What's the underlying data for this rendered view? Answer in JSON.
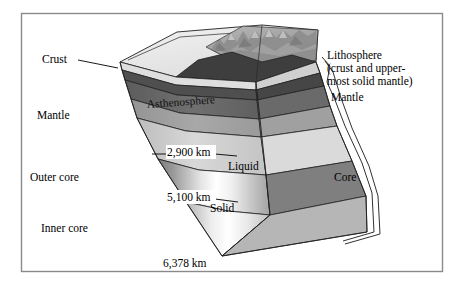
{
  "figure": {
    "frame": {
      "border_color": "#8a8a8a",
      "background": "#ffffff"
    }
  },
  "labels": {
    "crust": "Crust",
    "asthenosphere": "Asthenosphere",
    "mantle_left": "Mantle",
    "mantle_right": "Mantle",
    "outer_core": "Outer core",
    "inner_core": "Inner core",
    "liquid": "Liquid",
    "solid": "Solid",
    "core": "Core",
    "lithosphere_line1": "Lithosphere",
    "lithosphere_line2": "(crust and upper-",
    "lithosphere_line3": "most solid mantle)"
  },
  "depths": {
    "mantle_core_boundary": "2,900 km",
    "outer_inner_core_boundary": "5,100 km",
    "earth_radius": "6,378 km"
  },
  "colors": {
    "crust_top": "#e8e8e8",
    "crust_dark": "#4a4a4a",
    "asthenosphere": "#6b6b6b",
    "upper_mantle": "#9a9a9a",
    "lower_mantle": "#c8c8c8",
    "outer_core_edge": "#8f8f8f",
    "outer_core_center": "#ffffff",
    "inner_core": "#d5d5d5",
    "terrain": "#9c9c9c",
    "right_face_light": "#d8d8d8",
    "right_face_mid": "#a5a5a5",
    "right_face_dark": "#636363",
    "outline": "#1f1f1f"
  }
}
